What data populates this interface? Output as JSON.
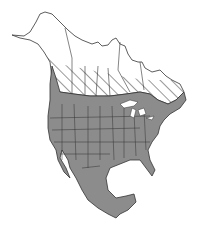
{
  "map": {
    "title": "North America range map",
    "regions": [
      {
        "name": "Alaska",
        "status": "summer-breeding-range",
        "pattern": "hatched"
      },
      {
        "name": "Northern Canada",
        "status": "summer-breeding-range",
        "pattern": "hatched"
      },
      {
        "name": "Southern Canada",
        "status": "year-round-range",
        "pattern": "solid"
      },
      {
        "name": "United States",
        "status": "year-round-range",
        "pattern": "solid"
      },
      {
        "name": "Mexico",
        "status": "year-round-range",
        "pattern": "solid"
      }
    ],
    "colors": {
      "solid_fill": "#8c8c8c",
      "border": "#333333",
      "hatch_line": "#555555",
      "background": "#ffffff",
      "unfilled_land": "#ffffff"
    }
  }
}
